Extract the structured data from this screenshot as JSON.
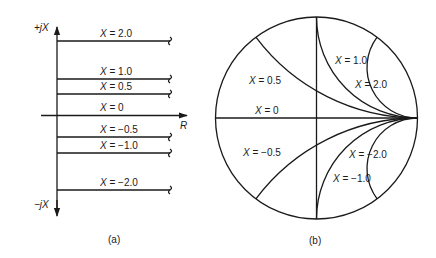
{
  "panel_a": {
    "caption": "(a)",
    "axis_labels": {
      "positive_imag": "+jX",
      "negative_imag": "−jX",
      "real": "R"
    },
    "lines": [
      {
        "x": 2.0,
        "label_var": "X",
        "label_value": " = 2.0",
        "y": 41
      },
      {
        "x": 1.0,
        "label_var": "X",
        "label_value": " = 1.0",
        "y": 79
      },
      {
        "x": 0.5,
        "label_var": "X",
        "label_value": " = 0.5",
        "y": 94
      },
      {
        "x": 0,
        "label_var": "X",
        "label_value": " = 0",
        "y": 115
      },
      {
        "x": -0.5,
        "label_var": "X",
        "label_value": " = −0.5",
        "y": 137
      },
      {
        "x": -1.0,
        "label_var": "X",
        "label_value": " = −1.0",
        "y": 153
      },
      {
        "x": -2.0,
        "label_var": "X",
        "label_value": " = −2.0",
        "y": 190
      }
    ]
  },
  "panel_b": {
    "caption": "(b)",
    "circle": {
      "cx": 316.5,
      "cy": 118,
      "r": 101
    },
    "reactance_circles": [
      {
        "x": 0.5,
        "label_var": "X",
        "label_value": " = 0.5",
        "label_pos": [
          249,
          84
        ]
      },
      {
        "x": 1.0,
        "label_var": "X",
        "label_value": " = 1.0",
        "label_pos": [
          335,
          64
        ]
      },
      {
        "x": 2.0,
        "label_var": "X",
        "label_value": " = 2.0",
        "label_pos": [
          355,
          88
        ]
      },
      {
        "x": 0,
        "label_var": "X",
        "label_value": " = 0",
        "label_pos": [
          255,
          114
        ]
      },
      {
        "x": -0.5,
        "label_var": "X",
        "label_value": " = −0.5",
        "label_pos": [
          243,
          156
        ]
      },
      {
        "x": -2.0,
        "label_var": "X",
        "label_value": " = −2.0",
        "label_pos": [
          349,
          158
        ]
      },
      {
        "x": -1.0,
        "label_var": "X",
        "label_value": " = −1.0",
        "label_pos": [
          333,
          182
        ]
      }
    ]
  }
}
